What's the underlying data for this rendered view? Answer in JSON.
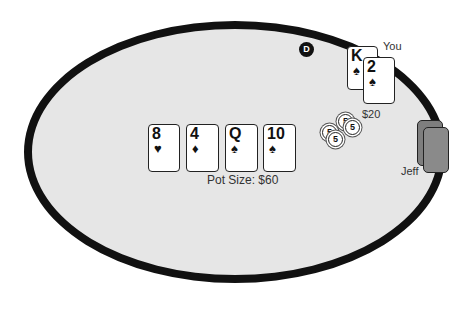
{
  "table": {
    "felt_color": "#e6e6e6",
    "rail_color": "#111111",
    "pot_label": "Pot Size: $60"
  },
  "community_cards": [
    {
      "rank": "8",
      "suit": "♥",
      "suit_name": "hearts"
    },
    {
      "rank": "4",
      "suit": "♦",
      "suit_name": "diamonds"
    },
    {
      "rank": "Q",
      "suit": "♠",
      "suit_name": "spades"
    },
    {
      "rank": "10",
      "suit": "♠",
      "suit_name": "spades"
    }
  ],
  "dealer_button": {
    "label": "D"
  },
  "players": {
    "you": {
      "name": "You",
      "bet": "$20",
      "hole_cards": [
        {
          "rank": "K",
          "suit": "♠",
          "suit_name": "spades"
        },
        {
          "rank": "2",
          "suit": "♠",
          "suit_name": "spades"
        }
      ],
      "chips": [
        "5",
        "5",
        "5",
        "5"
      ]
    },
    "jeff": {
      "name": "Jeff",
      "hole_cards": [
        "face-down",
        "face-down"
      ]
    }
  }
}
